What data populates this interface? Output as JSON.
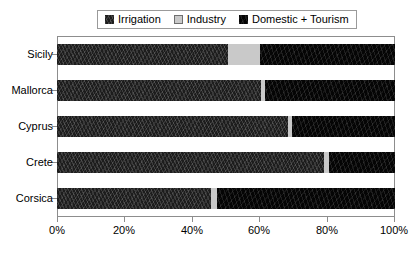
{
  "legend": {
    "position": "top",
    "entries": [
      {
        "label": "Irrigation",
        "key": "irrigation",
        "color": "#1d1d1d",
        "swatch_icon": "legend-swatch-irrigation"
      },
      {
        "label": "Industry",
        "key": "industry",
        "color": "#c9c9c9",
        "swatch_icon": "legend-swatch-industry"
      },
      {
        "label": "Domestic + Tourism",
        "key": "domestic",
        "color": "#050505",
        "swatch_icon": "legend-swatch-domestic"
      }
    ]
  },
  "axes": {
    "x": {
      "ticks": [
        "0%",
        "20%",
        "40%",
        "60%",
        "80%",
        "100%"
      ],
      "tick_values": [
        0,
        20,
        40,
        60,
        80,
        100
      ],
      "min": 0,
      "max": 100,
      "label": ""
    },
    "y": {
      "ticks": [
        "Sicily",
        "Mallorca",
        "Cyprus",
        "Crete",
        "Corsica"
      ],
      "label": ""
    }
  },
  "chart_data": {
    "type": "bar",
    "orientation": "horizontal",
    "stacked": true,
    "normalized": true,
    "title": "",
    "subtitle": "",
    "xlabel": "",
    "ylabel": "",
    "xlim": [
      0,
      100
    ],
    "xticks": [
      0,
      20,
      40,
      60,
      80,
      100
    ],
    "xticklabels": [
      "0%",
      "20%",
      "40%",
      "60%",
      "80%",
      "100%"
    ],
    "grid": false,
    "legend": [
      "Irrigation",
      "Industry",
      "Domestic + Tourism"
    ],
    "legend_position": "top",
    "categories": [
      "Sicily",
      "Mallorca",
      "Cyprus",
      "Crete",
      "Corsica"
    ],
    "series": [
      {
        "name": "Irrigation",
        "color": "#1d1d1d",
        "values": [
          50.6,
          60.5,
          68.3,
          79.0,
          45.6
        ]
      },
      {
        "name": "Industry",
        "color": "#c9c9c9",
        "values": [
          9.4,
          1.0,
          1.1,
          1.5,
          1.8
        ]
      },
      {
        "name": "Domestic + Tourism",
        "color": "#050505",
        "values": [
          40.0,
          38.5,
          30.6,
          19.5,
          52.6
        ]
      }
    ],
    "bars": [
      {
        "category": "Sicily",
        "irrigation": 50.6,
        "industry": 9.4,
        "domestic": 40.0
      },
      {
        "category": "Mallorca",
        "irrigation": 60.5,
        "industry": 1.0,
        "domestic": 38.5
      },
      {
        "category": "Cyprus",
        "irrigation": 68.3,
        "industry": 1.1,
        "domestic": 30.6
      },
      {
        "category": "Crete",
        "irrigation": 79.0,
        "industry": 1.5,
        "domestic": 19.5
      },
      {
        "category": "Corsica",
        "irrigation": 45.6,
        "industry": 1.8,
        "domestic": 52.6
      }
    ]
  }
}
